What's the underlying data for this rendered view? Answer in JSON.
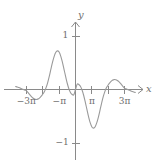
{
  "figure": {
    "kind": "cartesian-plot",
    "width": 159,
    "height": 168,
    "background": "#ffffff",
    "axis_color": "#8a8a8a",
    "curve_color": "#9a9a9a",
    "label_color": "#6e6e6e"
  },
  "axes": {
    "x_axis_label": "x",
    "y_axis_label": "y",
    "x_ticks": [
      {
        "value": -3,
        "label": "−3π",
        "show_label": true
      },
      {
        "value": -2,
        "label": "",
        "show_label": false
      },
      {
        "value": -1,
        "label": "−π",
        "show_label": true
      },
      {
        "value": 1,
        "label": "π",
        "show_label": true
      },
      {
        "value": 2,
        "label": "",
        "show_label": false
      },
      {
        "value": 3,
        "label": "3π",
        "show_label": true
      }
    ],
    "y_ticks": [
      {
        "value": 1,
        "label": "1",
        "show_label": true
      },
      {
        "value": -1,
        "label": "−1",
        "show_label": true
      }
    ],
    "xlim": [
      -3.65,
      3.65
    ],
    "ylim": [
      -1.45,
      1.42
    ],
    "grid": false
  },
  "chart_data": {
    "type": "line",
    "title": "",
    "xlabel": "x",
    "ylabel": "y",
    "xlim": [
      -3.65,
      3.65
    ],
    "ylim": [
      -1.45,
      1.42
    ],
    "grid": false,
    "legend": "none",
    "x_tick_labels": [
      "−3π",
      "−π",
      "π",
      "3π"
    ],
    "y_tick_labels": [
      "1",
      "−1"
    ],
    "x_units": "pi",
    "series": [
      {
        "name": "damped-oscillation",
        "color": "#9a9a9a",
        "x": [
          -3.65,
          -3.55,
          -3.45,
          -3.35,
          -3.25,
          -3.15,
          -3.05,
          -3.0,
          -2.9,
          -2.8,
          -2.7,
          -2.6,
          -2.5,
          -2.4,
          -2.3,
          -2.2,
          -2.1,
          -2.0,
          -1.9,
          -1.8,
          -1.7,
          -1.6,
          -1.5,
          -1.4,
          -1.3,
          -1.2,
          -1.1,
          -1.0,
          -0.9,
          -0.8,
          -0.7,
          -0.6,
          -0.5,
          -0.4,
          -0.3,
          -0.2,
          -0.1,
          0.0,
          0.1,
          0.2,
          0.3,
          0.4,
          0.5,
          0.6,
          0.7,
          0.8,
          0.9,
          1.0,
          1.1,
          1.2,
          1.3,
          1.4,
          1.5,
          1.6,
          1.7,
          1.8,
          1.9,
          2.0,
          2.1,
          2.2,
          2.3,
          2.4,
          2.5,
          2.6,
          2.7,
          2.8,
          2.9,
          3.0,
          3.05,
          3.15,
          3.25,
          3.35,
          3.45,
          3.55,
          3.65
        ],
        "y": [
          0.055,
          0.048,
          0.037,
          0.024,
          0.01,
          -0.004,
          -0.016,
          -0.022,
          -0.055,
          -0.092,
          -0.128,
          -0.158,
          -0.178,
          -0.186,
          -0.18,
          -0.161,
          -0.13,
          -0.09,
          -0.04,
          0.03,
          0.125,
          0.245,
          0.38,
          0.51,
          0.62,
          0.695,
          0.722,
          0.7,
          0.625,
          0.512,
          0.378,
          0.24,
          0.112,
          0.01,
          -0.06,
          -0.095,
          -0.098,
          0.0,
          0.098,
          0.095,
          0.06,
          -0.01,
          -0.112,
          -0.24,
          -0.378,
          -0.512,
          -0.625,
          -0.7,
          -0.722,
          -0.695,
          -0.62,
          -0.51,
          -0.38,
          -0.245,
          -0.125,
          -0.03,
          0.04,
          0.09,
          0.13,
          0.161,
          0.18,
          0.186,
          0.178,
          0.158,
          0.128,
          0.092,
          0.055,
          0.022,
          0.016,
          0.004,
          -0.01,
          -0.024,
          -0.037,
          -0.048,
          -0.055
        ]
      }
    ],
    "key_points": {
      "zero_crossings_pi_units": [
        -3,
        -2,
        -1,
        0,
        1,
        2,
        3
      ],
      "local_minimum": {
        "x_pi": -1.1,
        "y": -0.72
      },
      "local_maximum": {
        "x_pi": 1.1,
        "y": 0.72
      },
      "secondary_maximum": {
        "x_pi": 2.4,
        "y": 0.19
      },
      "secondary_minimum": {
        "x_pi": -2.4,
        "y": -0.19
      }
    }
  }
}
